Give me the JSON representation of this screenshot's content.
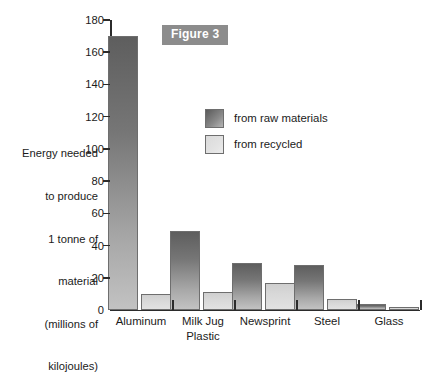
{
  "figure": {
    "badge_label": "Figure 3"
  },
  "chart_data": {
    "type": "bar",
    "title": "Figure 3",
    "xlabel": "",
    "ylabel": "Energy needed to produce 1 tonne of material (millions of kilojoules)",
    "ylabel_lines": [
      "Energy needed",
      "to produce",
      "1 tonne of",
      "material",
      "(millions of",
      "kilojoules)"
    ],
    "categories": [
      "Aluminum",
      "Milk Jug\nPlastic",
      "Newsprint",
      "Steel",
      "Glass"
    ],
    "category_labels": [
      "Aluminum",
      "Milk Jug Plastic",
      "Newsprint",
      "Steel",
      "Glass"
    ],
    "series": [
      {
        "name": "from raw materials",
        "values": [
          170,
          49,
          29,
          28,
          4
        ]
      },
      {
        "name": "from recycled",
        "values": [
          10,
          11,
          17,
          7,
          2
        ]
      }
    ],
    "ylim": [
      0,
      180
    ],
    "yticks": [
      0,
      20,
      40,
      60,
      80,
      100,
      120,
      140,
      160,
      180
    ],
    "ytick_labels": [
      "0",
      "20",
      "40",
      "60",
      "80",
      "100",
      "120",
      "140",
      "160",
      "180"
    ],
    "grid": false,
    "legend_position": "upper center",
    "colors": {
      "raw_materials": "#767676",
      "recycled": "#d8d8d8",
      "axis": "#2b2b2b",
      "badge_background": "#8c8c8c",
      "badge_text": "#ffffff"
    }
  }
}
